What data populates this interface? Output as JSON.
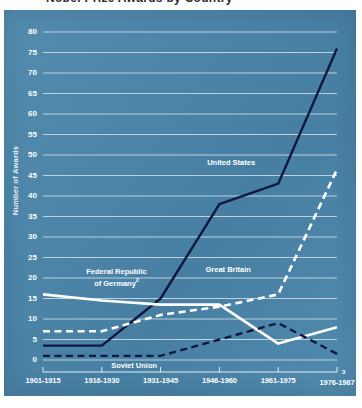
{
  "figure": {
    "title_cropped": "Nobel Prize Awards by Country",
    "background_color": "#4a86ab",
    "page_number": "3"
  },
  "chart_data": {
    "type": "line",
    "title": "Nobel Prize Awards by Country",
    "xlabel": "",
    "ylabel": "Number of Awards",
    "ylim": [
      0,
      80
    ],
    "ytick_step": 5,
    "grid": true,
    "legend_position": "inline-annotations",
    "categories": [
      "1901-1915",
      "1916-1930",
      "1931-1945",
      "1946-1960",
      "1961-1975",
      "1976-1987"
    ],
    "category_footnotes": {
      "1976-1987": "3"
    },
    "yticks": [
      0,
      5,
      10,
      15,
      20,
      25,
      30,
      35,
      40,
      45,
      50,
      55,
      60,
      65,
      70,
      75,
      80
    ],
    "series": [
      {
        "name": "United States",
        "style": "solid",
        "color": "#101840",
        "label_x_frac": 0.64,
        "label_y_value": 48,
        "values": [
          3.5,
          3.5,
          15,
          38,
          43,
          76
        ]
      },
      {
        "name": "Great Britain",
        "style": "dashed",
        "color": "#ffffff",
        "label_x_frac": 0.63,
        "label_y_value": 22,
        "values": [
          7,
          7,
          11,
          13,
          16,
          46.5
        ]
      },
      {
        "name": "Federal Republic of Germany",
        "footnote": "2",
        "style": "solid",
        "color": "#ffffff",
        "label_x_frac": 0.25,
        "label_y_value": 20,
        "values": [
          16,
          14.5,
          13.5,
          13.5,
          4,
          8
        ]
      },
      {
        "name": "Soviet Union",
        "style": "dashed",
        "color": "#101840",
        "label_x_frac": 0.31,
        "label_y_value": -1.5,
        "values": [
          1,
          1,
          1,
          5,
          9,
          1.5
        ]
      }
    ]
  },
  "annotations": {
    "united_states": "United States",
    "great_britain": "Great Britain",
    "germany_line1": "Federal Republic",
    "germany_line2": "of Germany",
    "germany_footnote": "2",
    "soviet_union": "Soviet Union"
  }
}
